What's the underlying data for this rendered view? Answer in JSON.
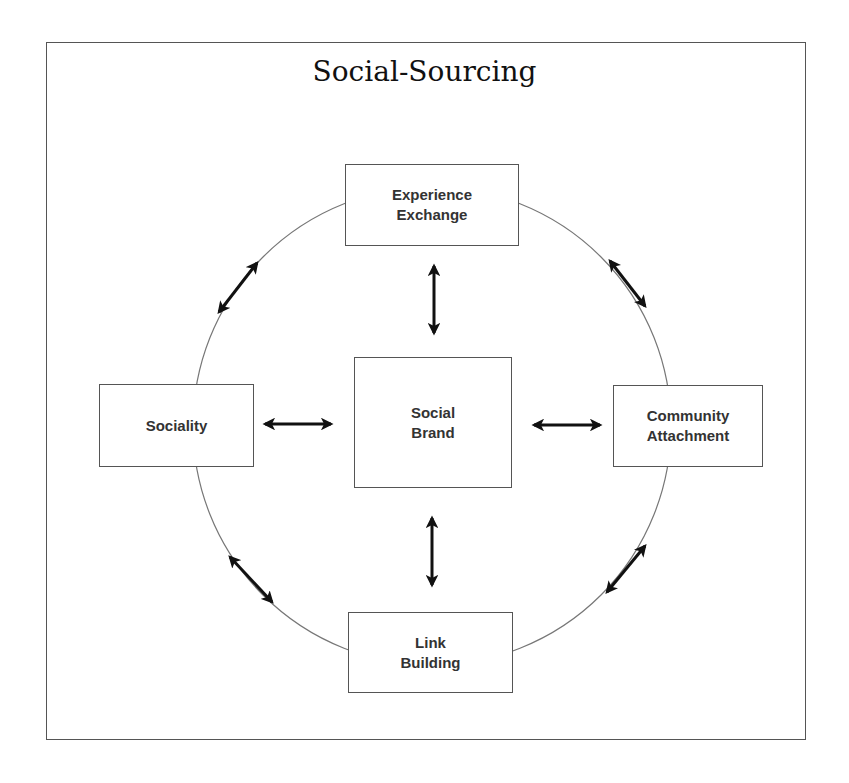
{
  "diagram": {
    "title": "Social-Sourcing",
    "colors": {
      "border": "#555555",
      "text": "#333333",
      "circle": "#777777",
      "arrow": "#111111"
    },
    "nodes": {
      "top": {
        "label": "Experience\nExchange"
      },
      "center": {
        "label": "Social\nBrand"
      },
      "left": {
        "label": "Sociality"
      },
      "right": {
        "label": "Community\nAttachment"
      },
      "bottom": {
        "label": "Link\nBuilding"
      }
    },
    "edges": [
      {
        "from": "Experience Exchange",
        "to": "Social Brand",
        "type": "bidirectional"
      },
      {
        "from": "Sociality",
        "to": "Social Brand",
        "type": "bidirectional"
      },
      {
        "from": "Community Attachment",
        "to": "Social Brand",
        "type": "bidirectional"
      },
      {
        "from": "Link Building",
        "to": "Social Brand",
        "type": "bidirectional"
      },
      {
        "from": "Experience Exchange",
        "to": "Sociality",
        "type": "bidirectional",
        "path": "circle-arc"
      },
      {
        "from": "Experience Exchange",
        "to": "Community Attachment",
        "type": "bidirectional",
        "path": "circle-arc"
      },
      {
        "from": "Sociality",
        "to": "Link Building",
        "type": "bidirectional",
        "path": "circle-arc"
      },
      {
        "from": "Community Attachment",
        "to": "Link Building",
        "type": "bidirectional",
        "path": "circle-arc"
      }
    ]
  }
}
